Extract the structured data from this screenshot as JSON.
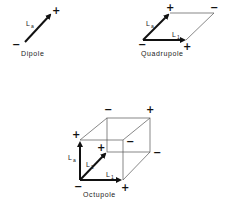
{
  "figures": {
    "dipole": {
      "caption": "Dipole",
      "vector_label": "L",
      "vector_sub": "a",
      "plus": "+",
      "minus": "−"
    },
    "quadrupole": {
      "caption": "Quadrupole",
      "vector_a_label": "L",
      "vector_a_sub": "a",
      "vector_b_label": "L",
      "vector_b_sub": "1",
      "signs": [
        "+",
        "−",
        "−",
        "+"
      ]
    },
    "octupole": {
      "caption": "Octupole",
      "vector_a_label": "L",
      "vector_a_sub": "a",
      "vector_b_label": "L",
      "vector_b_sub": "1",
      "vector_c_label": "L",
      "vector_c_sub": "2",
      "signs": [
        "−",
        "+",
        "−",
        "−",
        "+",
        "+",
        "−",
        "+"
      ]
    }
  },
  "colors": {
    "line": "#111111",
    "thin_line": "#555555",
    "background": "#ffffff"
  }
}
